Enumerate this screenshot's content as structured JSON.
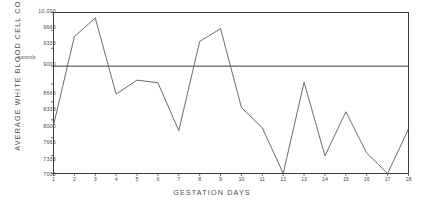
{
  "chart_data": {
    "type": "line",
    "title": "",
    "xlabel": "GESTATION DAYS",
    "ylabel": "AVERAGE WHITE BLOOD CELL COUNT",
    "x": [
      1,
      2,
      3,
      4,
      5,
      6,
      7,
      8,
      9,
      10,
      11,
      12,
      13,
      14,
      15,
      16,
      17,
      18
    ],
    "categories": [
      "1",
      "2",
      "3",
      "4",
      "5",
      "6",
      "7",
      "8",
      "9",
      "10",
      "11",
      "12",
      "13",
      "14",
      "15",
      "16",
      "17",
      "18"
    ],
    "values": [
      7900,
      9550,
      9900,
      8480,
      8740,
      8690,
      7800,
      9460,
      9700,
      8230,
      7850,
      7000,
      8700,
      7330,
      8150,
      7380,
      7000,
      7830
    ],
    "series": [
      {
        "name": "average white blood cell count",
        "values": [
          7900,
          9550,
          9900,
          8480,
          8740,
          8690,
          7800,
          9460,
          9700,
          8230,
          7850,
          7000,
          8700,
          7330,
          8150,
          7380,
          7000,
          7830
        ]
      }
    ],
    "reference_lines": [
      {
        "label": "controls",
        "value": 9000
      }
    ],
    "ylim": [
      7000,
      10000
    ],
    "xlim": [
      1,
      18
    ],
    "yticks": [
      7000,
      7333,
      7666,
      8000,
      8333,
      8666,
      9000,
      9333,
      9666,
      10000
    ],
    "ytick_labels": [
      "7000",
      "7333",
      "7666",
      "8000",
      "8333",
      "8666",
      "9000",
      "9333",
      "9666",
      "10,000"
    ],
    "xtick_labels": [
      "1",
      "2",
      "3",
      "4",
      "5",
      "6",
      "7",
      "8",
      "9",
      "10",
      "11",
      "12",
      "13",
      "14",
      "15",
      "16",
      "17",
      "18"
    ],
    "grid": false,
    "legend": "none",
    "line_color": "#555555",
    "axis_color": "#333333"
  }
}
